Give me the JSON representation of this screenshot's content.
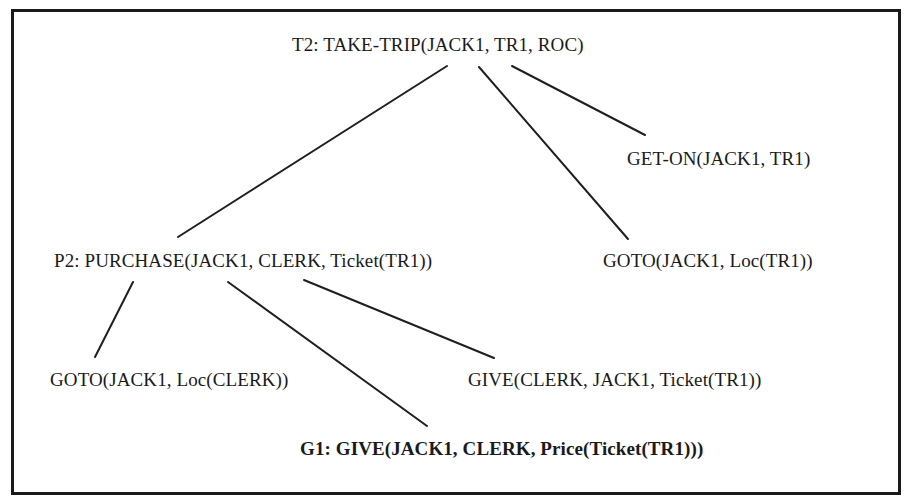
{
  "diagram": {
    "type": "plan-tree",
    "nodes": [
      {
        "id": "t2",
        "label": "T2:  TAKE-TRIP(JACK1, TR1, ROC)",
        "bold": false,
        "x": 292,
        "y": 34
      },
      {
        "id": "get-on",
        "label": "GET-ON(JACK1, TR1)",
        "bold": false,
        "x": 627,
        "y": 148
      },
      {
        "id": "p2",
        "label": "P2:  PURCHASE(JACK1, CLERK, Ticket(TR1))",
        "bold": false,
        "x": 54,
        "y": 250
      },
      {
        "id": "goto-tr1",
        "label": "GOTO(JACK1, Loc(TR1))",
        "bold": false,
        "x": 603,
        "y": 250
      },
      {
        "id": "goto-clerk",
        "label": "GOTO(JACK1, Loc(CLERK))",
        "bold": false,
        "x": 50,
        "y": 369
      },
      {
        "id": "give-ticket",
        "label": "GIVE(CLERK, JACK1, Ticket(TR1))",
        "bold": false,
        "x": 468,
        "y": 369
      },
      {
        "id": "g1",
        "label": "G1:  GIVE(JACK1, CLERK, Price(Ticket(TR1)))",
        "bold": true,
        "x": 300,
        "y": 438
      }
    ],
    "edges": [
      {
        "from": "t2",
        "to": "p2",
        "x1": 447,
        "y1": 66,
        "x2": 178,
        "y2": 237
      },
      {
        "from": "t2",
        "to": "goto-tr1",
        "x1": 479,
        "y1": 67,
        "x2": 628,
        "y2": 239
      },
      {
        "from": "t2",
        "to": "get-on",
        "x1": 512,
        "y1": 66,
        "x2": 645,
        "y2": 135
      },
      {
        "from": "p2",
        "to": "goto-clerk",
        "x1": 133,
        "y1": 282,
        "x2": 95,
        "y2": 357
      },
      {
        "from": "p2",
        "to": "g1",
        "x1": 228,
        "y1": 282,
        "x2": 427,
        "y2": 426
      },
      {
        "from": "p2",
        "to": "give-ticket",
        "x1": 304,
        "y1": 280,
        "x2": 494,
        "y2": 358
      }
    ]
  },
  "colors": {
    "ink": "#1a1a1a",
    "background": "#ffffff"
  }
}
